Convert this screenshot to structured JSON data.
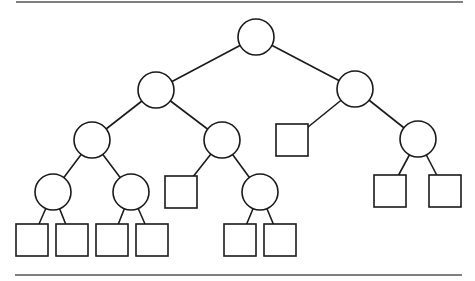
{
  "diagram": {
    "type": "binary-tree",
    "colors": {
      "stroke": "#1a1a1a",
      "fill": "#ffffff",
      "rule": "#555555"
    },
    "rules": [
      {
        "id": "top-rule",
        "x1": 16,
        "y1": 2,
        "x2": 463,
        "y2": 2
      },
      {
        "id": "bottom-rule",
        "x1": 15,
        "y1": 275,
        "x2": 462,
        "y2": 275
      }
    ],
    "circle_radius": 18,
    "square_size": 32,
    "internal_nodes": [
      {
        "id": "n0",
        "cx": 256,
        "cy": 37
      },
      {
        "id": "n1",
        "cx": 156,
        "cy": 90
      },
      {
        "id": "n2",
        "cx": 355,
        "cy": 89
      },
      {
        "id": "n3",
        "cx": 92,
        "cy": 140
      },
      {
        "id": "n4",
        "cx": 222,
        "cy": 140
      },
      {
        "id": "n5",
        "cx": 418,
        "cy": 139
      },
      {
        "id": "n6",
        "cx": 53,
        "cy": 192
      },
      {
        "id": "n7",
        "cx": 131,
        "cy": 192
      },
      {
        "id": "n8",
        "cx": 260,
        "cy": 192
      }
    ],
    "external_nodes": [
      {
        "id": "l0",
        "x": 276,
        "y": 124
      },
      {
        "id": "l1",
        "x": 165,
        "y": 176
      },
      {
        "id": "l2",
        "x": 374,
        "y": 175
      },
      {
        "id": "l3",
        "x": 429,
        "y": 175
      },
      {
        "id": "l4",
        "x": 16,
        "y": 224
      },
      {
        "id": "l5",
        "x": 56,
        "y": 224
      },
      {
        "id": "l6",
        "x": 96,
        "y": 224
      },
      {
        "id": "l7",
        "x": 136,
        "y": 224
      },
      {
        "id": "l8",
        "x": 224,
        "y": 224
      },
      {
        "id": "l9",
        "x": 264,
        "y": 224
      }
    ],
    "edges": [
      [
        "n0",
        "n1"
      ],
      [
        "n0",
        "n2"
      ],
      [
        "n1",
        "n3"
      ],
      [
        "n1",
        "n4"
      ],
      [
        "n2",
        "l0"
      ],
      [
        "n2",
        "n5"
      ],
      [
        "n3",
        "n6"
      ],
      [
        "n3",
        "n7"
      ],
      [
        "n4",
        "l1"
      ],
      [
        "n4",
        "n8"
      ],
      [
        "n5",
        "l2"
      ],
      [
        "n5",
        "l3"
      ],
      [
        "n6",
        "l4"
      ],
      [
        "n6",
        "l5"
      ],
      [
        "n7",
        "l6"
      ],
      [
        "n7",
        "l7"
      ],
      [
        "n8",
        "l8"
      ],
      [
        "n8",
        "l9"
      ]
    ]
  }
}
